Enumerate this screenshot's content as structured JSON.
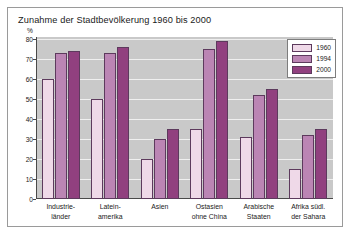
{
  "title": "Zunahme der Stadtbevölkerung 1960 bis 2000",
  "axis": {
    "unit_label": "%",
    "ticks": [
      "80",
      "70",
      "60",
      "50",
      "40",
      "30",
      "20",
      "10",
      "0"
    ]
  },
  "legend": {
    "items": [
      {
        "label": "1960",
        "color": "#efd9e8"
      },
      {
        "label": "1994",
        "color": "#bb85b4"
      },
      {
        "label": "2000",
        "color": "#91407f"
      }
    ]
  },
  "categories_display": [
    {
      "line1": "Industrie-",
      "line2": "länder"
    },
    {
      "line1": "Latein-",
      "line2": "amerika"
    },
    {
      "line1": "Asien",
      "line2": ""
    },
    {
      "line1": "Ostasien",
      "line2": "ohne China"
    },
    {
      "line1": "Arabische",
      "line2": "Staaten"
    },
    {
      "line1": "Afrika südl.",
      "line2": "der Sahara"
    }
  ],
  "chart_data": {
    "type": "bar",
    "title": "Zunahme der Stadtbevölkerung 1960 bis 2000",
    "xlabel": "",
    "ylabel": "%",
    "ylim": [
      0,
      80
    ],
    "yticks": [
      0,
      10,
      20,
      30,
      40,
      50,
      60,
      70,
      80
    ],
    "grid": true,
    "legend_position": "top-right",
    "categories": [
      "Industrieländer",
      "Lateinamerika",
      "Asien",
      "Ostasien ohne China",
      "Arabische Staaten",
      "Afrika südl. der Sahara"
    ],
    "series": [
      {
        "name": "1960",
        "color": "#efd9e8",
        "values": [
          60,
          50,
          20,
          35,
          31,
          15
        ]
      },
      {
        "name": "1994",
        "color": "#bb85b4",
        "values": [
          73,
          73,
          30,
          75,
          52,
          32
        ]
      },
      {
        "name": "2000",
        "color": "#91407f",
        "values": [
          74,
          76,
          35,
          79,
          55,
          35
        ]
      }
    ]
  }
}
